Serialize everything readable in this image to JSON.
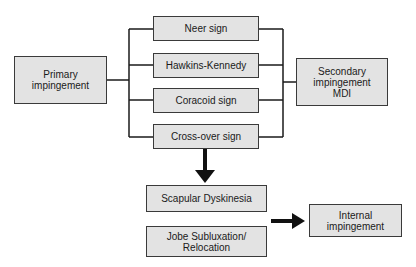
{
  "diagram": {
    "left_node": {
      "label": "Primary\nimpingement"
    },
    "right_node": {
      "label": "Secondary\nimpingement\nMDI"
    },
    "signs": [
      {
        "label": "Neer sign"
      },
      {
        "label": "Hawkins-Kennedy"
      },
      {
        "label": "Coracoid sign"
      },
      {
        "label": "Cross-over sign"
      }
    ],
    "lower_nodes": [
      {
        "label": "Scapular Dyskinesia"
      },
      {
        "label": "Jobe Subluxation/\nRelocation"
      }
    ],
    "result_node": {
      "label": "Internal\nimpingement"
    },
    "colors": {
      "box_fill": "#e3e3e3",
      "box_border": "#3a3a3a",
      "line": "#1a1a1a",
      "background": "#ffffff"
    }
  }
}
